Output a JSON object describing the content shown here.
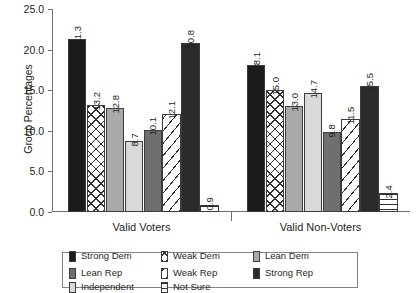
{
  "chart_data": {
    "type": "bar",
    "title": "",
    "subtitle": "",
    "xlabel": "",
    "ylabel": "Group Percentages",
    "ylim": [
      0,
      25
    ],
    "yticks": [
      "0.0",
      "5.0",
      "10.0",
      "15.0",
      "20.0",
      "25.0"
    ],
    "ytick_values": [
      0,
      5,
      10,
      15,
      20,
      25
    ],
    "grid": false,
    "legend_position": "bottom",
    "categories": [
      "Valid Voters",
      "Valid Non-Voters"
    ],
    "series": [
      {
        "name": "Strong Dem",
        "values": [
          21.3,
          18.1
        ],
        "fill": "solid-black",
        "color": "#1b1b1b"
      },
      {
        "name": "Weak Dem",
        "values": [
          13.2,
          15.0
        ],
        "fill": "crosshatch",
        "color": "#ffffff"
      },
      {
        "name": "Lean Dem",
        "values": [
          12.8,
          13.0
        ],
        "fill": "midgray",
        "color": "#a9a9a9"
      },
      {
        "name": "Independent",
        "values": [
          8.7,
          14.7
        ],
        "fill": "lightgray",
        "color": "#d9d9d9"
      },
      {
        "name": "Lean Rep",
        "values": [
          10.1,
          9.8
        ],
        "fill": "darkgray",
        "color": "#6f6f6f"
      },
      {
        "name": "Weak Rep",
        "values": [
          12.1,
          11.5
        ],
        "fill": "diagonal",
        "color": "#ffffff"
      },
      {
        "name": "Strong Rep",
        "values": [
          20.8,
          15.5
        ],
        "fill": "solid-dark",
        "color": "#2b2b2b"
      },
      {
        "name": "Not Sure",
        "values": [
          0.9,
          2.4
        ],
        "fill": "horizontal",
        "color": "#ffffff"
      }
    ],
    "value_labels": {
      "Valid Voters": [
        "21.3",
        "13.2",
        "12.8",
        "8.7",
        "10.1",
        "12.1",
        "20.8",
        "0.9"
      ],
      "Valid Non-Voters": [
        "18.1",
        "15.0",
        "13.0",
        "14.7",
        "9.8",
        "11.5",
        "15.5",
        "2.4"
      ]
    }
  },
  "legend": {
    "items": [
      {
        "label": "Strong Dem",
        "fill": "solid-black"
      },
      {
        "label": "Weak Dem",
        "fill": "crosshatch"
      },
      {
        "label": "Lean Dem",
        "fill": "midgray"
      },
      {
        "label": "Lean Rep",
        "fill": "darkgray"
      },
      {
        "label": "Weak Rep",
        "fill": "diagonal"
      },
      {
        "label": "Strong Rep",
        "fill": "solid-dark"
      },
      {
        "label": "Independent",
        "fill": "lightgray"
      },
      {
        "label": "Not Sure",
        "fill": "horizontal"
      }
    ]
  }
}
